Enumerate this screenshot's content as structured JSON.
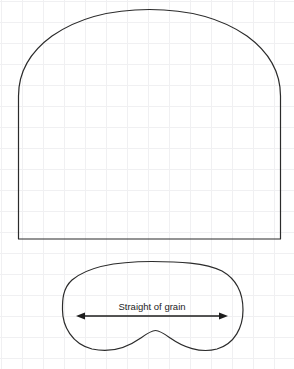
{
  "sheet": {
    "title": "Sewing pattern pieces",
    "width": 294,
    "height": 369,
    "background_color": "#ffffff",
    "grid": {
      "visible": true,
      "line_color": "#f0f0f2",
      "spacing_px": 21
    }
  },
  "pieces": [
    {
      "id": "arched-body-piece",
      "name": "Arched pattern piece",
      "description": "Large dome / arch shaped pattern piece with straight side edges, flat bottom edge and curved shoulders rising to a rounded apex.",
      "stroke_color": "#2b2b2b",
      "stroke_width": 1.2,
      "fill": "none",
      "bounds": {
        "x": 18,
        "y": 9,
        "width": 262,
        "height": 230
      },
      "path": "M 18.5 239 L 18.5 96 C 18.5 72 30 52 52 36 C 78 18 113 9.5 149.5 9.5 C 186 9.5 221 18 247 36 C 269 52 280.5 72 280.5 96 L 280.5 239 Z"
    },
    {
      "id": "kidney-facing-piece",
      "name": "Kidney shaped pattern piece",
      "description": "Rounded bean / kidney shaped pattern piece with a notch bump rising from the centre of the lower edge.",
      "stroke_color": "#2b2b2b",
      "stroke_width": 1.2,
      "fill": "none",
      "bounds": {
        "x": 62,
        "y": 261,
        "width": 181,
        "height": 89
      },
      "path": "M 152 261.5 C 114 261.5 86 268 72 280 C 62 289 62.5 302 62.5 310 C 62.5 326 72 344 92 349 C 112 353.5 128 347 140 338.5 C 147 333.5 151 330.5 155.5 330.5 C 160 330.5 164 333.5 171 338.5 C 183 347 200 353.5 217 349 C 235 343.5 243 327 243 310 C 243 292 236 279 222 271 C 205 262.5 178 261.5 152 261.5 Z"
    }
  ],
  "annotations": [
    {
      "id": "straight-of-grain",
      "name": "Straight of grain marking",
      "label": "Straight of grain",
      "label_position": {
        "x": 152,
        "y": 310
      },
      "label_color": "#1d1d1d",
      "label_font_size": 9.5,
      "arrow": {
        "type": "double-headed",
        "y": 316,
        "x_start": 76,
        "x_end": 228,
        "color": "#1d1d1d",
        "stroke_width": 1.3,
        "head_length": 8,
        "head_half_width": 3.4
      }
    }
  ]
}
